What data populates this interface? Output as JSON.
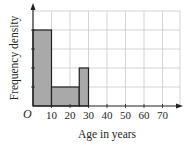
{
  "chart_data": {
    "type": "bar",
    "subtype": "histogram",
    "title": "",
    "xlabel": "Age in years",
    "ylabel": "Frequency density",
    "origin_label": "O",
    "x_ticks": [
      10,
      20,
      30,
      40,
      50,
      60,
      70
    ],
    "xlim": [
      0,
      80
    ],
    "ylim": [
      0,
      5
    ],
    "y_gridlines": [
      1,
      2,
      3,
      4,
      5
    ],
    "grid": true,
    "legend": null,
    "bins": [
      {
        "from": 0,
        "to": 10,
        "frequency_density": 4
      },
      {
        "from": 10,
        "to": 25,
        "frequency_density": 1
      },
      {
        "from": 25,
        "to": 30,
        "frequency_density": 2
      }
    ],
    "categories": [
      "0-10",
      "10-25",
      "25-30"
    ],
    "values": [
      4,
      1,
      2
    ],
    "colors": {
      "bar_fill": "#a9a9a9",
      "bar_stroke": "#231f20",
      "grid": "#c9c9c9",
      "axis": "#231f20"
    }
  }
}
